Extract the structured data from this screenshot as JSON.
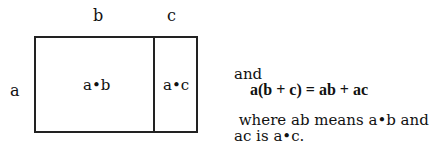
{
  "diagram": {
    "top_labels": {
      "b": "b",
      "c": "c"
    },
    "side_label": "a",
    "cells": [
      {
        "label": "a•b"
      },
      {
        "label": "a•c"
      }
    ]
  },
  "text": {
    "intro": "and",
    "equation": "a(b + c) = ab + ac",
    "note_line1": " where ab means a•b and",
    "note_line2": "ac is a•c."
  }
}
